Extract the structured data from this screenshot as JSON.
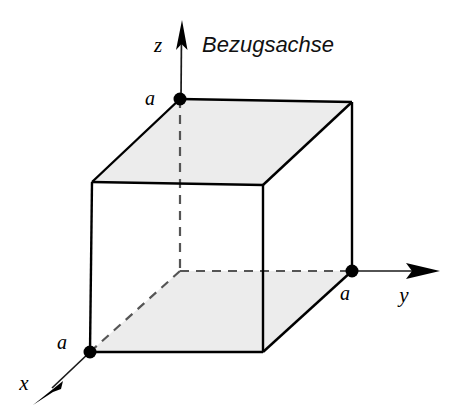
{
  "figure": {
    "title": "Bezugsachse",
    "caption": "Bezugsachse",
    "background_color": "#ffffff",
    "line_color": "#000000",
    "face_shade_color": "#ececec",
    "dashed_color": "#555555"
  },
  "axes": {
    "z": {
      "label": "z",
      "label_x": 158,
      "label_y": 52,
      "tip_x": 182,
      "tip_y": 20
    },
    "y": {
      "label": "y",
      "label_x": 404,
      "label_y": 302,
      "tip_x": 440,
      "tip_y": 271
    },
    "x": {
      "label": "x",
      "label_x": 24,
      "label_y": 390,
      "tip_x": 33,
      "tip_y": 405
    }
  },
  "dimensions": [
    {
      "name": "edge-length-z",
      "label": "a",
      "x": 150,
      "y": 105
    },
    {
      "name": "edge-length-y",
      "label": "a",
      "x": 345,
      "y": 300
    },
    {
      "name": "edge-length-x",
      "label": "a",
      "x": 62,
      "y": 349
    }
  ],
  "vertices": [
    {
      "name": "top-back-left",
      "x": 180,
      "y": 99,
      "marked": true
    },
    {
      "name": "top-back-right",
      "x": 352,
      "y": 102,
      "marked": false
    },
    {
      "name": "top-front-left",
      "x": 92,
      "y": 182,
      "marked": false
    },
    {
      "name": "top-front-right",
      "x": 263,
      "y": 185,
      "marked": false
    },
    {
      "name": "bottom-back-left",
      "x": 180,
      "y": 271,
      "marked": false
    },
    {
      "name": "bottom-back-right",
      "x": 352,
      "y": 271,
      "marked": true
    },
    {
      "name": "bottom-front-left",
      "x": 90,
      "y": 352,
      "marked": true
    },
    {
      "name": "bottom-front-right",
      "x": 263,
      "y": 352,
      "marked": false
    }
  ],
  "shaded_faces": [
    {
      "name": "top-face",
      "points": "180,99 352,102 263,185 92,182"
    },
    {
      "name": "bottom-face",
      "points": "180,271 352,271 263,352 90,352"
    }
  ],
  "solid_edges": [
    {
      "name": "edge-top-back-left-to-top-back-right",
      "x1": 180,
      "y1": 99,
      "x2": 352,
      "y2": 102
    },
    {
      "name": "edge-top-back-left-to-top-front-left",
      "x1": 180,
      "y1": 99,
      "x2": 92,
      "y2": 182
    },
    {
      "name": "edge-top-back-right-to-top-front-right",
      "x1": 352,
      "y1": 102,
      "x2": 263,
      "y2": 185
    },
    {
      "name": "edge-top-front-left-to-top-front-right",
      "x1": 92,
      "y1": 182,
      "x2": 263,
      "y2": 185
    },
    {
      "name": "edge-top-front-left-to-bottom-front-left",
      "x1": 92,
      "y1": 182,
      "x2": 90,
      "y2": 352
    },
    {
      "name": "edge-top-front-right-to-bottom-front-right",
      "x1": 263,
      "y1": 185,
      "x2": 263,
      "y2": 352
    },
    {
      "name": "edge-top-back-right-to-bottom-back-right",
      "x1": 352,
      "y1": 102,
      "x2": 352,
      "y2": 271
    },
    {
      "name": "edge-bottom-front-left-to-bottom-front-right",
      "x1": 90,
      "y1": 352,
      "x2": 263,
      "y2": 352
    },
    {
      "name": "edge-bottom-front-right-to-bottom-back-right",
      "x1": 263,
      "y1": 352,
      "x2": 352,
      "y2": 271
    }
  ],
  "hidden_edges": [
    {
      "name": "hidden-edge-vertical",
      "x1": 180,
      "y1": 99,
      "x2": 180,
      "y2": 271
    },
    {
      "name": "hidden-edge-bottom-back",
      "x1": 180,
      "y1": 271,
      "x2": 352,
      "y2": 271
    },
    {
      "name": "hidden-edge-bottom-left-diagonal",
      "x1": 180,
      "y1": 271,
      "x2": 90,
      "y2": 352
    }
  ]
}
